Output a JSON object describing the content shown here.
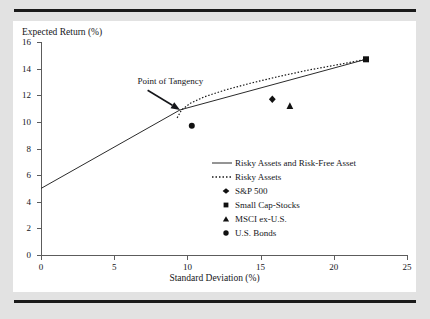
{
  "figure": {
    "y_axis_label": "Expected Return (%)",
    "x_axis_label": "Standard Deviation (%)",
    "annotation": "Point of Tangency"
  },
  "legend": {
    "items": [
      {
        "key": "solid-line",
        "label": "Risky Assets and Risk-Free Asset"
      },
      {
        "key": "dotted-line",
        "label": "Risky Assets"
      },
      {
        "key": "diamond-marker",
        "label": "S&P 500"
      },
      {
        "key": "square-marker",
        "label": "Small Cap-Stocks"
      },
      {
        "key": "triangle-marker",
        "label": "MSCI ex-U.S."
      },
      {
        "key": "circle-marker",
        "label": "U.S. Bonds"
      }
    ]
  },
  "chart_data": {
    "type": "line",
    "title": "",
    "xlabel": "Standard Deviation (%)",
    "ylabel": "Expected Return (%)",
    "xlim": [
      0,
      25
    ],
    "ylim": [
      0,
      16
    ],
    "xticks": [
      0,
      5,
      10,
      15,
      20,
      25
    ],
    "yticks": [
      0,
      2,
      4,
      6,
      8,
      10,
      12,
      14,
      16
    ],
    "grid": false,
    "legend_position": "inside-right",
    "annotations": [
      {
        "text": "Point of Tangency",
        "x": 6.6,
        "y": 12.9,
        "points_to_x": 9.5,
        "points_to_y": 10.9
      }
    ],
    "series": [
      {
        "name": "Risky Assets and Risk-Free Asset",
        "style": "solid",
        "x": [
          0.0,
          9.5,
          22.2
        ],
        "y": [
          5.0,
          10.9,
          14.7
        ]
      },
      {
        "name": "Risky Assets",
        "style": "dotted",
        "x": [
          9.3,
          9.6,
          10.2,
          11.2,
          12.6,
          14.3,
          16.2,
          18.3,
          20.3,
          22.2
        ],
        "y": [
          10.3,
          10.9,
          11.4,
          11.9,
          12.4,
          12.9,
          13.4,
          13.9,
          14.3,
          14.7
        ]
      }
    ],
    "points": [
      {
        "name": "S&P 500",
        "marker": "diamond",
        "x": 15.8,
        "y": 11.7
      },
      {
        "name": "Small Cap-Stocks",
        "marker": "square",
        "x": 22.2,
        "y": 14.7
      },
      {
        "name": "MSCI ex-U.S.",
        "marker": "triangle",
        "x": 17.0,
        "y": 11.2
      },
      {
        "name": "U.S. Bonds",
        "marker": "circle",
        "x": 10.3,
        "y": 9.7
      }
    ]
  },
  "colors": {
    "page_background": "#e2e2e2",
    "panel": "#ffffff",
    "ink": "#15161a",
    "axis": "#5c5c5c",
    "rule": "#1a1a1a"
  }
}
